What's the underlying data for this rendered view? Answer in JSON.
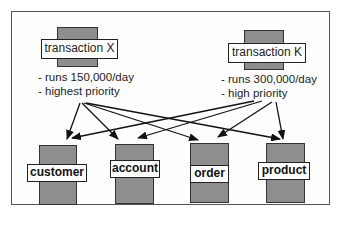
{
  "transactions": [
    {
      "label": "transaction X",
      "notes": [
        "- runs 150,000/day",
        "- highest priority"
      ]
    },
    {
      "label": "transaction K",
      "notes": [
        "- runs 300,000/day",
        "- high priority"
      ]
    }
  ],
  "entities": [
    {
      "label": "customer"
    },
    {
      "label": "account"
    },
    {
      "label": "order"
    },
    {
      "label": "product"
    }
  ],
  "edges": [
    {
      "from": "transaction X",
      "to": "customer"
    },
    {
      "from": "transaction X",
      "to": "account"
    },
    {
      "from": "transaction X",
      "to": "order"
    },
    {
      "from": "transaction X",
      "to": "product"
    },
    {
      "from": "transaction K",
      "to": "customer"
    },
    {
      "from": "transaction K",
      "to": "account"
    },
    {
      "from": "transaction K",
      "to": "order"
    },
    {
      "from": "transaction K",
      "to": "product"
    }
  ],
  "colors": {
    "box_fill": "#8e8e8e",
    "label_fill": "#ffffff",
    "stroke": "#222222"
  }
}
